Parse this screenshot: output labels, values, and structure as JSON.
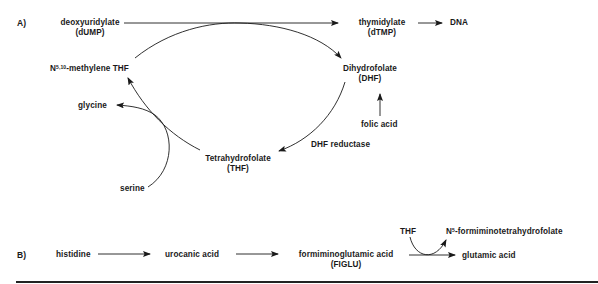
{
  "panel_a": {
    "label": "A)",
    "nodes": {
      "dump": {
        "name": "deoxyuridylate",
        "abbr": "(dUMP)"
      },
      "dtmp": {
        "name": "thymidylate",
        "abbr": "(dTMP)"
      },
      "dna": {
        "name": "DNA"
      },
      "methylene_thf": {
        "prefix": "N",
        "sup": "5,10",
        "name": "-methylene THF"
      },
      "dhf": {
        "name": "Dihydrofolate",
        "abbr": "(DHF)"
      },
      "folic_acid": {
        "name": "folic acid"
      },
      "glycine": {
        "name": "glycine"
      },
      "serine": {
        "name": "serine"
      },
      "thf": {
        "name": "Tetrahydrofolate",
        "abbr": "(THF)"
      }
    },
    "enzyme": "DHF reductase"
  },
  "panel_b": {
    "label": "B)",
    "nodes": {
      "histidine": {
        "name": "histidine"
      },
      "urocanic": {
        "name": "urocanic acid"
      },
      "figlu": {
        "name": "formiminoglutamic acid",
        "abbr": "(FIGLU)"
      },
      "thf": {
        "name": "THF"
      },
      "formimino_thf": {
        "prefix": "N",
        "sup": "5",
        "name": "-formiminotetrahydrofolate"
      },
      "glutamic": {
        "name": "glutamic acid"
      }
    }
  },
  "colors": {
    "ink": "#1a1a1a",
    "background": "#ffffff"
  }
}
